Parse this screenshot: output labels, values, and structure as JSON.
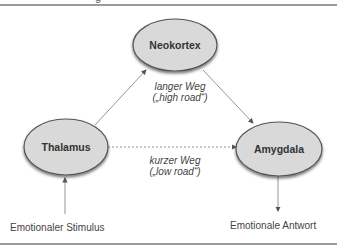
{
  "title_fragment": "g",
  "nodes": {
    "neokortex": "Neokortex",
    "thalamus": "Thalamus",
    "amygdala": "Amygdala"
  },
  "edges": {
    "long_path": {
      "line1": "langer Weg",
      "line2": "(„high road“)"
    },
    "short_path": {
      "line1": "kurzer Weg",
      "line2": "(„low road“)"
    }
  },
  "io": {
    "input": "Emotionaler Stimulus",
    "output": "Emotionale Antwort"
  },
  "colors": {
    "node_fill": "#d9d9d9",
    "node_stroke": "#555555",
    "line": "#777777",
    "rule": "#9a9a9a"
  }
}
